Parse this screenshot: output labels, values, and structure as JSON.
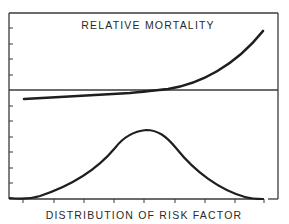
{
  "chart_data": [
    {
      "type": "line",
      "panel": "top",
      "title": "RELATIVE MORTALITY",
      "xlabel": "",
      "ylabel": "",
      "grid": false,
      "legend": null,
      "reference_line": {
        "y": 1.0,
        "label": ""
      },
      "x": [
        0.0,
        0.1,
        0.2,
        0.3,
        0.4,
        0.5,
        0.6,
        0.7,
        0.8,
        0.9,
        1.0
      ],
      "series": [
        {
          "name": "Relative mortality",
          "values": [
            0.86,
            0.87,
            0.885,
            0.9,
            0.93,
            0.97,
            1.02,
            1.1,
            1.22,
            1.42,
            1.75
          ]
        }
      ],
      "ylim": [
        0.6,
        1.8
      ],
      "y_tick_count_above_reference": 4,
      "y_tick_count_below_reference": 6,
      "tick_labels_shown": false
    },
    {
      "type": "area",
      "panel": "bottom",
      "title": "",
      "xlabel": "DISTRIBUTION OF RISK FACTOR",
      "ylabel": "",
      "grid": false,
      "legend": null,
      "x": [
        0.0,
        0.1,
        0.2,
        0.3,
        0.4,
        0.5,
        0.6,
        0.7,
        0.8,
        0.9,
        1.0
      ],
      "series": [
        {
          "name": "Frequency distribution",
          "values": [
            0.0,
            0.04,
            0.17,
            0.36,
            0.62,
            0.98,
            0.85,
            0.55,
            0.27,
            0.08,
            0.0
          ]
        }
      ],
      "ylim": [
        0,
        1.1
      ],
      "x_tick_count": 9,
      "tick_labels_shown": false
    }
  ],
  "labels": {
    "top_title": "RELATIVE MORTALITY",
    "x_axis_label": "DISTRIBUTION OF RISK FACTOR"
  },
  "colors": {
    "ink": "#1e1e1e",
    "axis": "#3a3a3a",
    "background": "#ffffff"
  },
  "geometry": {
    "frame": {
      "left": 9,
      "top": 13,
      "right": 278,
      "bottom": 199
    },
    "reference_line_y": 90,
    "y_ticks": [
      28,
      44,
      59,
      75,
      106,
      121,
      137,
      152,
      168,
      183
    ],
    "x_ticks": [
      23,
      54,
      84,
      114,
      144,
      175,
      205,
      235,
      264
    ],
    "mortality_path": "M24,99 C60,97 100,95 130,93 C150,91 160,90 168,89 C200,84 235,66 263,31",
    "distribution_path": "M10,198 C20,199 30,199 40,196 C70,186 95,172 115,148 C125,135 135,131 146,130 C158,130 166,136 176,148 C195,172 220,190 245,197 C252,199 258,199 263,199"
  }
}
